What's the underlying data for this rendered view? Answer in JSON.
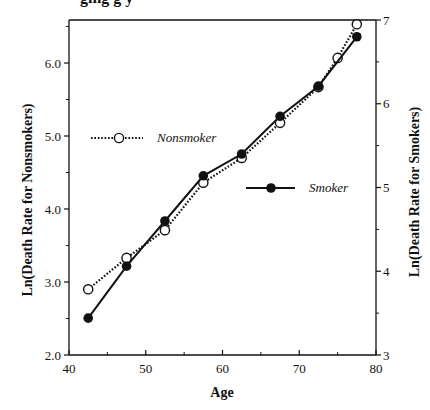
{
  "chart_data": {
    "type": "line",
    "title": "",
    "xlabel": "Age",
    "ylabel_left": "Ln(Death  Rate  for  Nonsmokers)",
    "ylabel_right": "Ln(Death  Rate  for  Smokers)",
    "xlim": [
      40,
      80
    ],
    "ylim_left": [
      2.0,
      6.59
    ],
    "ylim_right": [
      3,
      7
    ],
    "x_ticks": [
      40,
      50,
      60,
      70,
      80
    ],
    "x_tick_labels": [
      "40",
      "50",
      "60",
      "70",
      "80"
    ],
    "y_left_ticks": [
      2.0,
      3.0,
      4.0,
      5.0,
      6.0
    ],
    "y_left_tick_labels": [
      "2.0",
      "3.0",
      "4.0",
      "5.0",
      "6.0"
    ],
    "y_right_ticks": [
      3,
      4,
      5,
      6,
      7
    ],
    "y_right_tick_labels": [
      "3",
      "4",
      "5",
      "6",
      "7"
    ],
    "grid": false,
    "series": [
      {
        "name": "Nonsmoker",
        "axis": "left",
        "line_style": "dotted",
        "marker": "open-circle",
        "x": [
          42.5,
          47.5,
          52.5,
          57.5,
          62.5,
          67.5,
          72.5,
          75.0,
          77.5
        ],
        "values": [
          2.9,
          3.33,
          3.71,
          4.36,
          4.7,
          5.18,
          5.67,
          6.07,
          6.53
        ]
      },
      {
        "name": "Smoker",
        "axis": "right",
        "line_style": "solid",
        "marker": "filled-circle",
        "x": [
          42.5,
          47.5,
          52.5,
          57.5,
          62.5,
          67.5,
          72.5,
          77.5
        ],
        "values": [
          3.44,
          4.06,
          4.6,
          5.14,
          5.4,
          5.85,
          6.21,
          6.8
        ]
      }
    ],
    "legend": [
      {
        "label": "Nonsmoker",
        "position": "upper-left-inside"
      },
      {
        "label": "Smoker",
        "position": "center-right-inside"
      }
    ]
  },
  "labels": {
    "xlabel": "Age",
    "ylabel_left": "Ln(Death  Rate  for  Nonsmokers)",
    "ylabel_right": "Ln(Death  Rate  for  Smokers)",
    "legend_nonsmoker": "Nonsmoker",
    "legend_smoker": "Smoker",
    "clipped_title_fragment": "ging  g                    y"
  },
  "colors": {
    "ink": "#111111",
    "background": "#ffffff"
  }
}
